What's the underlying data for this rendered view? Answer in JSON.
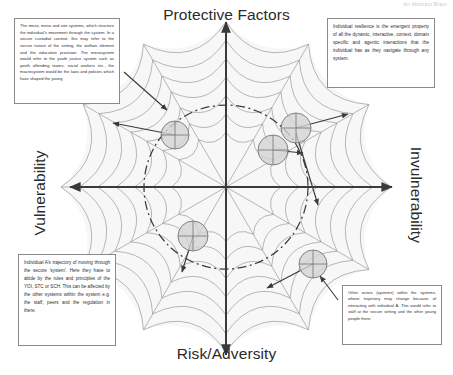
{
  "header": {
    "watermark": "An Abstract Brain"
  },
  "axes": {
    "top_label": "Protective Factors",
    "bottom_label": "Risk/Adversity",
    "left_label": "Vulnerability",
    "right_label": "Invulnerability"
  },
  "callouts": {
    "top_left": "The micro, meso and exo systems, which structure the individual's movement through the system. In a secure custodial context, this may refer to the secure nature of the setting, the welfare element and the education provision.  The mesosystem would refer to the youth justice system such as youth offending teams, social workers etc., the macrosystem would be the laws and policies which have shaped the young",
    "top_right": "Individual resilience is the emergent property of all the dynamic, interactive, context, domain specific and agentic interactions that the individual has as they navigate through any system.",
    "bottom_left": "Individual A's trajectory of moving through the secure 'system'. Here they have to abide by the rules and principles of the YOI, STC or SCH.  This can be affected by the other systems within the system e.g. the staff, peers and the regulation in there.",
    "bottom_right": "Other actors (systems) within the systems, whose trajectory may change because of interacting with individual A. This would refer to staff at the secure setting and the other young people there."
  },
  "diagram": {
    "type": "conceptual-spider-web-quadrant",
    "center": {
      "x": 226,
      "y": 187
    },
    "web": {
      "radials": 12,
      "rings": 7,
      "outer_radius": 165,
      "stroke_color": "#9a9a9a",
      "fill_color": "#f7f7f7"
    },
    "resilience_circle": {
      "label": "resilience boundary",
      "style": "dash-dot",
      "radius": 82,
      "stroke_color": "#3c3c3c"
    },
    "axis_stroke_color": "#3a3a3a",
    "nodes": [
      {
        "name": "node-upper-left",
        "x": 175,
        "y": 135,
        "r": 14,
        "arrow_to": {
          "x": 113,
          "y": 123
        }
      },
      {
        "name": "node-upper-right",
        "x": 296,
        "y": 128,
        "r": 15,
        "arrow_to": {
          "x": 348,
          "y": 114
        }
      },
      {
        "name": "node-center-right",
        "x": 273,
        "y": 150,
        "r": 15,
        "arrow_to": {
          "x": 303,
          "y": 153
        }
      },
      {
        "name": "node-lower-left",
        "x": 193,
        "y": 236,
        "r": 15,
        "arrow_to": {
          "x": 182,
          "y": 272
        }
      },
      {
        "name": "node-lower-right",
        "x": 313,
        "y": 264,
        "r": 14,
        "arrow_to": {
          "x": 267,
          "y": 288
        }
      }
    ],
    "connector_arrows": [
      {
        "name": "callout-tl-pointer",
        "from": {
          "x": 124,
          "y": 72
        },
        "to": {
          "x": 167,
          "y": 110
        }
      },
      {
        "name": "trajectory-a-arrow",
        "from": {
          "x": 296,
          "y": 133
        },
        "to": {
          "x": 318,
          "y": 205
        }
      },
      {
        "name": "callout-br-pointer",
        "from": {
          "x": 338,
          "y": 300
        },
        "to": {
          "x": 320,
          "y": 276
        }
      }
    ]
  },
  "colors": {
    "web_stroke": "#9a9a9a",
    "web_fill": "#f7f7f7",
    "axis": "#3a3a3a",
    "node_fill": "#d4d4d4",
    "node_stroke": "#6f6f6f",
    "callout_border": "#8a8a8a",
    "text": "#2e2e2e"
  }
}
